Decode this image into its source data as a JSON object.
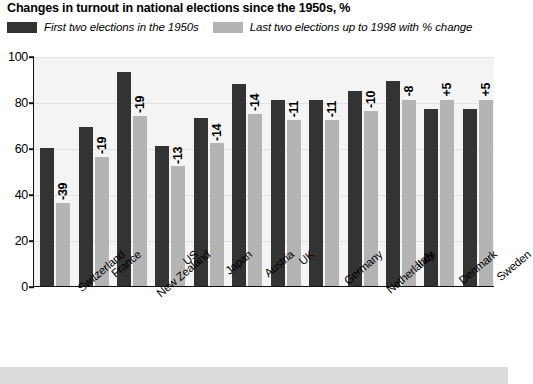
{
  "chart_data": {
    "type": "bar",
    "title": "Changes in turnout in national elections since the 1950s, %",
    "xlabel": "",
    "ylabel": "",
    "ylim": [
      0,
      100
    ],
    "yticks": [
      0,
      20,
      40,
      60,
      80,
      100
    ],
    "grid": true,
    "legend_position": "top-left",
    "categories": [
      "Switzerland",
      "France",
      "New Zealand",
      "US",
      "Japan",
      "Austria",
      "UK",
      "Germany",
      "Netherlands",
      "Italy",
      "Denmark",
      "Sweden"
    ],
    "series": [
      {
        "name": "First two elections in the 1950s",
        "color": "#333333",
        "values": [
          60,
          69,
          93,
          61,
          73,
          88,
          81,
          81,
          85,
          89,
          77,
          77
        ]
      },
      {
        "name": "Last two elections up to 1998 with % change",
        "color": "#b4b4b4",
        "values": [
          36,
          56,
          74,
          52,
          62,
          75,
          72,
          72,
          76,
          81,
          81,
          81
        ]
      }
    ],
    "annotations": [
      "-39",
      "-19",
      "-19",
      "-13",
      "-14",
      "-14",
      "-11",
      "-11",
      "-10",
      "-8",
      "+5",
      "+5"
    ]
  },
  "legend": {
    "items": [
      {
        "label": "First two elections in the 1950s",
        "color": "#333333"
      },
      {
        "label": "Last two elections up to 1998 with % change",
        "color": "#b4b4b4"
      }
    ]
  },
  "colors": {
    "dark_bar": "#333333",
    "light_bar": "#b4b4b4",
    "plot_background": "#f4f4f4",
    "axis": "#111111",
    "footer_band": "#dcdcdc"
  }
}
